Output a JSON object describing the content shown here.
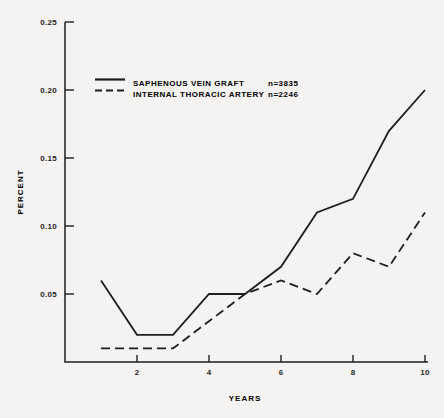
{
  "figure": {
    "background": "#f4f3f1",
    "line_color": "#1f1e1c"
  },
  "chart_data": {
    "type": "line",
    "title": "",
    "xlabel": "YEARS",
    "ylabel": "PERCENT",
    "x": [
      1,
      2,
      3,
      4,
      5,
      6,
      7,
      8,
      9,
      10
    ],
    "xlim": [
      0,
      10
    ],
    "ylim": [
      0,
      0.25
    ],
    "x_ticks": [
      "2",
      "4",
      "6",
      "8",
      "10"
    ],
    "y_ticks": [
      "0.25",
      "0.20",
      "0.15",
      "0.10",
      "0.05"
    ],
    "grid": false,
    "legend_position": "upper-left-inside",
    "series": [
      {
        "name": "SAPHENOUS VEIN GRAFT",
        "n_label": "n=3835",
        "style": "solid",
        "values": [
          0.06,
          0.02,
          0.02,
          0.05,
          0.05,
          0.07,
          0.11,
          0.12,
          0.17,
          0.2
        ]
      },
      {
        "name": "INTERNAL THORACIC ARTERY",
        "n_label": "n=2246",
        "style": "dashed",
        "values": [
          0.01,
          0.01,
          0.01,
          0.03,
          0.05,
          0.06,
          0.05,
          0.08,
          0.07,
          0.11
        ]
      }
    ]
  }
}
